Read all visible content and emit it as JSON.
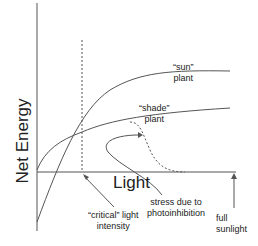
{
  "diagram": {
    "y_axis_label": "Net Energy",
    "x_axis_label": "Light",
    "sun_label_1": "“sun”",
    "sun_label_2": "plant",
    "shade_label_1": "“shade”",
    "shade_label_2": "plant",
    "critical_1": "“critical” light",
    "critical_2": "intensity",
    "stress_1": "stress due to",
    "stress_2": "photoinhibition",
    "full_1": "full",
    "full_2": "sunlight"
  }
}
